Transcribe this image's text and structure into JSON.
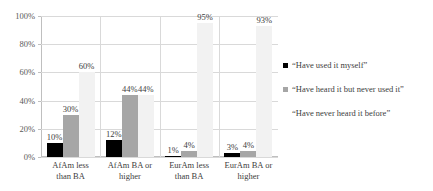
{
  "chart_data": {
    "type": "bar",
    "title": "",
    "subtitle": "",
    "xlabel": "",
    "ylabel": "",
    "ylim": [
      0,
      100
    ],
    "ytick_labels": [
      "100%",
      "80%",
      "60%",
      "40%",
      "20%",
      "0%"
    ],
    "ytick_values": [
      100,
      80,
      60,
      40,
      20,
      0
    ],
    "grid": true,
    "legend_position": "right",
    "categories": [
      "AfAm less than BA",
      "AfAm BA or higher",
      "EurAm less than BA",
      "EurAm BA or higher"
    ],
    "category_lines": [
      [
        "AfAm less",
        "than BA"
      ],
      [
        "AfAm BA or",
        "higher"
      ],
      [
        "EurAm less",
        "than BA"
      ],
      [
        "EurAm BA or",
        "higher"
      ]
    ],
    "series": [
      {
        "name": "“Have used it myself”",
        "color": "#000000",
        "values": [
          10,
          12,
          1,
          3
        ],
        "labels": [
          "10%",
          "12%",
          "1%",
          "3%"
        ]
      },
      {
        "name": "“Have heard it but never used it”",
        "color": "#a6a6a6",
        "values": [
          30,
          44,
          4,
          4
        ],
        "labels": [
          "30%",
          "44%",
          "4%",
          "4%"
        ]
      },
      {
        "name": "“Have never heard it before”",
        "color": "#f2f2f2",
        "values": [
          60,
          44,
          95,
          93
        ],
        "labels": [
          "60%",
          "44%",
          "95%",
          "93%"
        ]
      }
    ]
  }
}
